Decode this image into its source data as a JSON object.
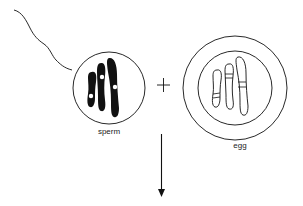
{
  "diagram": {
    "sperm": {
      "label": "sperm",
      "chromosome_count": 3,
      "chromosome_style": "filled"
    },
    "operator": "+",
    "egg": {
      "label": "egg",
      "chromosome_count": 3,
      "chromosome_style": "outlined"
    },
    "arrow": {
      "direction": "down"
    },
    "colors": {
      "ink": "#111111",
      "background": "#ffffff"
    }
  }
}
